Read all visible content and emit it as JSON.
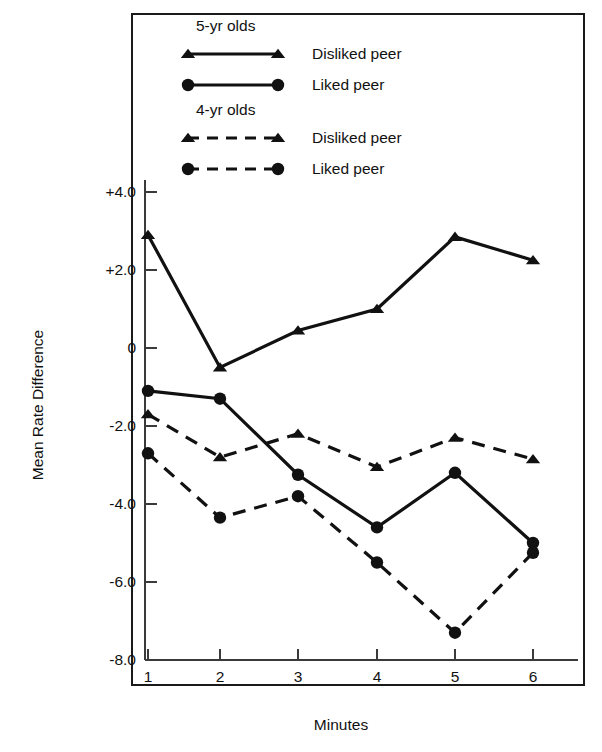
{
  "chart_data": {
    "type": "line",
    "title": "",
    "xlabel": "Minutes",
    "ylabel": "Mean Rate Difference",
    "x": [
      1,
      2,
      3,
      4,
      5,
      6
    ],
    "xticklabels": [
      "1",
      "2",
      "3",
      "4",
      "5",
      "6"
    ],
    "yticklabels": [
      "+4.0",
      "+2.0",
      "0",
      "-2.0",
      "-4.0",
      "-6.0",
      "-8.0"
    ],
    "ytickvalues": [
      4.0,
      2.0,
      0,
      -2.0,
      -4.0,
      -6.0,
      -8.0
    ],
    "ylim": [
      -8.6,
      4.6
    ],
    "xlim": [
      0.6,
      6.5
    ],
    "grid": false,
    "legend_position": "top-center-inside",
    "series": [
      {
        "name": "5-yr olds Disliked peer",
        "group": "5-yr olds",
        "label": "Disliked peer",
        "marker": "triangle",
        "line": "solid",
        "color": "#111111",
        "values": [
          2.9,
          -0.5,
          0.45,
          1.0,
          2.85,
          2.25
        ]
      },
      {
        "name": "5-yr olds Liked peer",
        "group": "5-yr olds",
        "label": "Liked peer",
        "marker": "circle",
        "line": "solid",
        "color": "#111111",
        "values": [
          -1.1,
          -1.3,
          -3.25,
          -4.6,
          -3.2,
          -5.0
        ]
      },
      {
        "name": "4-yr olds Disliked peer",
        "group": "4-yr olds",
        "label": "Disliked peer",
        "marker": "triangle",
        "line": "dashed",
        "color": "#111111",
        "values": [
          -1.7,
          -2.8,
          -2.2,
          -3.05,
          -2.3,
          -2.85
        ]
      },
      {
        "name": "4-yr olds Liked peer",
        "group": "4-yr olds",
        "label": "Liked peer",
        "marker": "circle",
        "line": "dashed",
        "color": "#111111",
        "values": [
          -2.7,
          -4.35,
          -3.8,
          -5.5,
          -7.3,
          -5.25
        ]
      }
    ]
  },
  "legend": {
    "groups": [
      {
        "title": "5-yr olds",
        "rows": [
          {
            "label": "Disliked peer",
            "marker": "triangle",
            "line": "solid"
          },
          {
            "label": "Liked peer",
            "marker": "circle",
            "line": "solid"
          }
        ]
      },
      {
        "title": "4-yr olds",
        "rows": [
          {
            "label": "Disliked peer",
            "marker": "triangle",
            "line": "dashed"
          },
          {
            "label": "Liked peer",
            "marker": "circle",
            "line": "dashed"
          }
        ]
      }
    ]
  },
  "axes": {
    "ylabel": "Mean Rate Difference",
    "xlabel": "Minutes"
  }
}
